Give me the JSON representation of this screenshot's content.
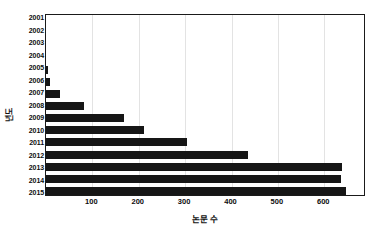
{
  "chart_data": {
    "type": "bar",
    "orientation": "horizontal",
    "title": "",
    "xlabel": "논문 수",
    "ylabel": "년도",
    "categories": [
      "2001",
      "2002",
      "2003",
      "2004",
      "2005",
      "2006",
      "2007",
      "2008",
      "2009",
      "2010",
      "2011",
      "2012",
      "2013",
      "2014",
      "2015"
    ],
    "values": [
      0,
      0,
      0,
      0,
      5,
      9,
      31,
      82,
      168,
      211,
      305,
      435,
      638,
      637,
      646
    ],
    "xlim": [
      0,
      690
    ],
    "ylim": null,
    "xticks": [
      100,
      200,
      300,
      400,
      500,
      600
    ],
    "xtick_labels": [
      "100",
      "200",
      "300",
      "400",
      "500",
      "600"
    ],
    "grid": "vertical",
    "legend": null,
    "bar_color": "#161616",
    "axis_color": "#1a1a1a",
    "grid_color": "#e3e3e3",
    "background_color": "#ffffff"
  }
}
